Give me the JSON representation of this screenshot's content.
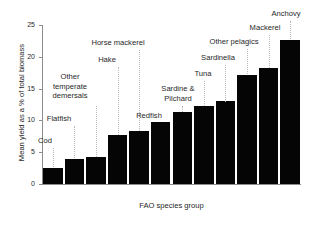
{
  "chart_data": {
    "type": "bar",
    "title": "",
    "xlabel": "FAO species group",
    "ylabel": "Mean yield as a % of total biomass",
    "ylim": [
      0,
      25
    ],
    "yticks": [
      0,
      5,
      10,
      15,
      20,
      25
    ],
    "ytick_labels": [
      "0",
      "5",
      "10",
      "15",
      "20",
      "25"
    ],
    "grid": false,
    "legend": null,
    "bar_color": "#050505",
    "axis_color": "#8c8c8c",
    "leader_color": "#b9b9b9",
    "categories": [
      "Cod",
      "Flatfish",
      "Other\ntemperate\ndemersals",
      "Hake",
      "Horse mackerel",
      "Redfish",
      "Sardine &\nPilchard",
      "Tuna",
      "Sardinella",
      "Other pelagics",
      "Mackerel",
      "Anchovy"
    ],
    "values": [
      2.5,
      3.9,
      4.2,
      7.7,
      8.3,
      9.8,
      11.3,
      12.3,
      13.0,
      17.2,
      18.3,
      22.6
    ],
    "annotations": [
      {
        "label": "Cod",
        "value": 2.5
      },
      {
        "label": "Flatfish",
        "value": 3.9
      },
      {
        "label": "Other temperate demersals",
        "value": 4.2
      },
      {
        "label": "Hake",
        "value": 7.7
      },
      {
        "label": "Horse mackerel",
        "value": 8.3
      },
      {
        "label": "Redfish",
        "value": 9.8
      },
      {
        "label": "Sardine & Pilchard",
        "value": 11.3
      },
      {
        "label": "Tuna",
        "value": 12.3
      },
      {
        "label": "Sardinella",
        "value": 13.0
      },
      {
        "label": "Other pelagics",
        "value": 17.2
      },
      {
        "label": "Mackerel",
        "value": 18.3
      },
      {
        "label": "Anchovy",
        "value": 22.6
      }
    ]
  },
  "label_layout": [
    {
      "text": "Cod",
      "left": 22,
      "top": 136,
      "width": 46,
      "leader_top": 148,
      "leader_bottom": 167
    },
    {
      "text": "Flatfish",
      "left": 36,
      "top": 114,
      "width": 46,
      "leader_top": 126,
      "leader_bottom": 158
    },
    {
      "text": "Other\ntemperate\ndemersals",
      "left": 43,
      "top": 72,
      "width": 54,
      "leader_top": 106,
      "leader_bottom": 157
    },
    {
      "text": "Hake",
      "left": 84,
      "top": 55,
      "width": 46,
      "leader_top": 67,
      "leader_bottom": 135
    },
    {
      "text": "Horse mackerel",
      "left": 82,
      "top": 38,
      "width": 72,
      "leader_top": 50,
      "leader_bottom": 131
    },
    {
      "text": "Redfish",
      "left": 126,
      "top": 111,
      "width": 46,
      "leader_top": 123,
      "leader_bottom": 122
    },
    {
      "text": "Sardine &\nPilchard",
      "left": 150,
      "top": 84,
      "width": 56,
      "leader_top": 106,
      "leader_bottom": 112
    },
    {
      "text": "Tuna",
      "left": 180,
      "top": 69,
      "width": 46,
      "leader_top": 81,
      "leader_bottom": 106
    },
    {
      "text": "Sardinella",
      "left": 190,
      "top": 53,
      "width": 56,
      "leader_top": 65,
      "leader_bottom": 102
    },
    {
      "text": "Other pelagics",
      "left": 199,
      "top": 37,
      "width": 70,
      "leader_top": 49,
      "leader_bottom": 74
    },
    {
      "text": "Mackerel",
      "left": 237,
      "top": 23,
      "width": 56,
      "leader_top": 35,
      "leader_bottom": 68
    },
    {
      "text": "Anchovy",
      "left": 258,
      "top": 9,
      "width": 56,
      "leader_top": 21,
      "leader_bottom": 39
    }
  ]
}
